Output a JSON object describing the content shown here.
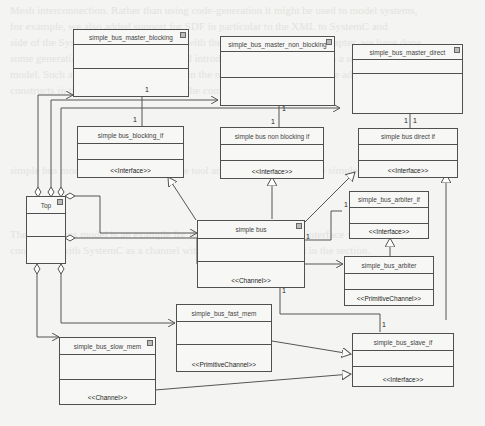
{
  "diagram": {
    "type": "uml-class-diagram",
    "classes": [
      {
        "id": "top",
        "name": "Top",
        "stereotype": "",
        "has_icon": true
      },
      {
        "id": "master_blocking",
        "name": "simple_bus_master_blocking",
        "stereotype": "",
        "has_icon": true
      },
      {
        "id": "master_non_blocking",
        "name": "simple_bus_master_non_blocking",
        "stereotype": "",
        "has_icon": true
      },
      {
        "id": "master_direct",
        "name": "simple_bus_master_direct",
        "stereotype": "",
        "has_icon": true
      },
      {
        "id": "blocking_if",
        "name": "simple bus_blocking_if",
        "stereotype": "<<Interface>>",
        "has_icon": false
      },
      {
        "id": "non_blocking_if",
        "name": "simple bus non blocking if",
        "stereotype": "<<Interface>>",
        "has_icon": false
      },
      {
        "id": "direct_if",
        "name": "simple bus direct if",
        "stereotype": "<<Interface>>",
        "has_icon": false
      },
      {
        "id": "simple_bus",
        "name": "simple bus",
        "stereotype": "<<Channel>>",
        "has_icon": true
      },
      {
        "id": "arbiter_if",
        "name": "simple_bus_arbiter_if",
        "stereotype": "<<Interface>>",
        "has_icon": false
      },
      {
        "id": "arbiter",
        "name": "simple_bus_arbiter",
        "stereotype": "<<PrimitiveChannel>>",
        "has_icon": false
      },
      {
        "id": "fast_mem",
        "name": "simple_bus_fast_mem",
        "stereotype": "<<PrimitiveChannel>>",
        "has_icon": false
      },
      {
        "id": "slow_mem",
        "name": "simple_bus_slow_mem",
        "stereotype": "<<Channel>>",
        "has_icon": true
      },
      {
        "id": "slave_if",
        "name": "simple_bus_slave_if",
        "stereotype": "<<Interface>>",
        "has_icon": false
      }
    ],
    "relations": [
      {
        "from": "top",
        "to": "master_blocking",
        "kind": "aggregation"
      },
      {
        "from": "top",
        "to": "master_non_blocking",
        "kind": "aggregation"
      },
      {
        "from": "top",
        "to": "master_direct",
        "kind": "aggregation"
      },
      {
        "from": "top",
        "to": "simple_bus",
        "kind": "aggregation"
      },
      {
        "from": "top",
        "to": "arbiter",
        "kind": "aggregation"
      },
      {
        "from": "top",
        "to": "fast_mem",
        "kind": "aggregation"
      },
      {
        "from": "top",
        "to": "slow_mem",
        "kind": "aggregation"
      },
      {
        "from": "master_blocking",
        "to": "blocking_if",
        "kind": "association",
        "mult_from": "1",
        "mult_to": "1"
      },
      {
        "from": "master_non_blocking",
        "to": "non_blocking_if",
        "kind": "association",
        "mult_from": "1",
        "mult_to": "1"
      },
      {
        "from": "master_direct",
        "to": "direct_if",
        "kind": "association",
        "mult_from": "1",
        "mult_to": "1"
      },
      {
        "from": "simple_bus",
        "to": "blocking_if",
        "kind": "realization"
      },
      {
        "from": "simple_bus",
        "to": "non_blocking_if",
        "kind": "realization"
      },
      {
        "from": "simple_bus",
        "to": "direct_if",
        "kind": "realization"
      },
      {
        "from": "simple_bus",
        "to": "arbiter_if",
        "kind": "association",
        "mult_from": "1",
        "mult_to": "1"
      },
      {
        "from": "simple_bus",
        "to": "slave_if",
        "kind": "association",
        "mult_from": "1",
        "mult_to": "1"
      },
      {
        "from": "arbiter",
        "to": "arbiter_if",
        "kind": "realization"
      },
      {
        "from": "fast_mem",
        "to": "slave_if",
        "kind": "realization"
      },
      {
        "from": "slow_mem",
        "to": "slave_if",
        "kind": "realization"
      }
    ],
    "multiplicities": [
      "1",
      "1",
      "1",
      "1",
      "1",
      "1",
      "1",
      "1",
      "1",
      "1"
    ]
  },
  "background_bleed": "Mesh interconnection. Rather than using code-generation it might be used to model systems,\nfor example, we also added support for SDF in particular to the XML to SystemC and\nside of the SystemC code and the UML with the SC generation. In this chapter, we have done\nsome generation in the specifications and introduced it, we have this to do a small bus\nmodel. Such a model example is shown in the next figure and in one of the additional\nconstructs in the tool and used to create the complete model in the tool.\n\n\n\n\nsimple bus model which is used with the tool and described here for the simple bus\n\n\n\nThe simple bus model is an example for the modeling of a bus and interface with the simple\nconnection with SystemC as a channel with the approach described in the section."
}
